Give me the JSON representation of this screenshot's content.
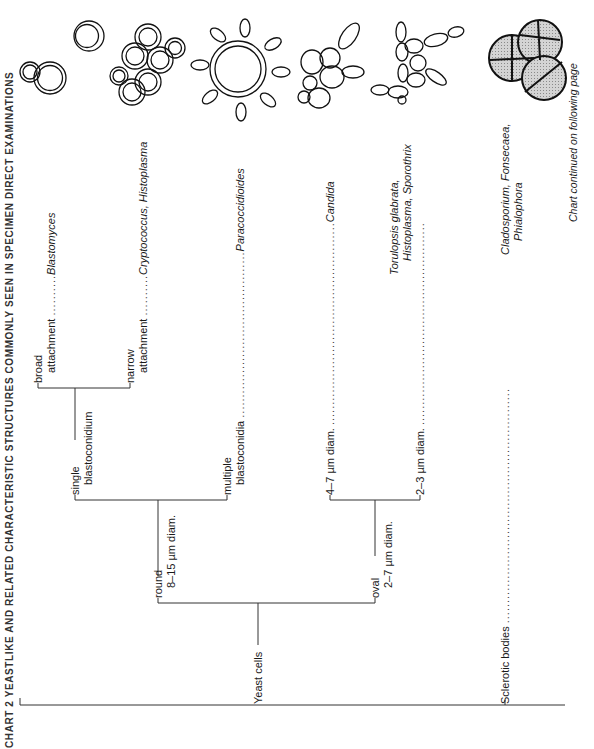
{
  "header": {
    "text": "CHART 2  YEASTLIKE AND RELATED CHARACTERISTIC STRUCTURES COMMONLY SEEN IN SPECIMEN DIRECT EXAMINATIONS",
    "orientation": "rotated 90° counter-clockwise, partly clipped at left edge"
  },
  "footer_note": "Chart continued on following page",
  "tree": {
    "root_items": [
      {
        "label": "Yeast cells"
      },
      {
        "label": "Sclerotic bodies",
        "dots": "..........................................................",
        "result": "Cladosporium, Fonsecaea,",
        "result_line2": "Phialophora"
      }
    ],
    "round": {
      "label": "round",
      "sub": "8–15 µm diam."
    },
    "oval": {
      "label": "oval",
      "sub": "2–7 µm diam."
    },
    "single": {
      "label": "single",
      "sub": "blastoconidium"
    },
    "multiple": {
      "label": "multiple",
      "sub": "blastoconidia",
      "dots": ".........................................",
      "result": "Paracoccidioides"
    },
    "broad": {
      "label": "broad",
      "sub": "attachment",
      "dots": "..........",
      "result": "Blastomyces"
    },
    "narrow": {
      "label": "narrow",
      "sub": "attachment",
      "dots": "..........",
      "result": "Cryptococcus, Histoplasma"
    },
    "size_4_7": {
      "label": "4–7 µm diam.",
      "dots": "..................................................",
      "result": "Candida"
    },
    "size_2_3": {
      "label": "2–3 µm diam.",
      "dots": "..................................................",
      "result": "Torulopsis glabrata,",
      "result_line2": "Histoplasma, Sporothrix"
    }
  },
  "illustrations": [
    {
      "name": "blastomyces-cells",
      "description": "broad-based budding yeast"
    },
    {
      "name": "cryptococcus-histoplasma-cells",
      "description": "narrow-based budding encapsulated yeasts"
    },
    {
      "name": "paracoccidioides-cell",
      "description": "large cell with multiple buds (pilot wheel)"
    },
    {
      "name": "candida-cells",
      "description": "budding oval yeasts"
    },
    {
      "name": "torulopsis-histoplasma-sporothrix-cells",
      "description": "small oval budding yeasts"
    },
    {
      "name": "sclerotic-bodies",
      "description": "shaded septate muriform bodies"
    }
  ]
}
